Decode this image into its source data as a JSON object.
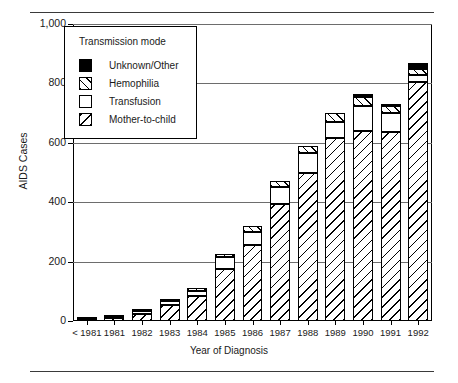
{
  "figure": {
    "y_axis_title": "AIDS Cases",
    "x_axis_title": "Year of Diagnosis"
  },
  "legend": {
    "title": "Transmission mode",
    "items": [
      {
        "label": "Unknown/Other",
        "pattern": "solid-black",
        "color": "#000000"
      },
      {
        "label": "Hemophilia",
        "pattern": "diagonal-up",
        "color": "#000000"
      },
      {
        "label": "Transfusion",
        "pattern": "empty-white",
        "color": "#ffffff"
      },
      {
        "label": "Mother-to-child",
        "pattern": "diagonal-down",
        "color": "#000000"
      }
    ]
  },
  "y_axis": {
    "ticks": [
      "0",
      "200",
      "400",
      "600",
      "800",
      "1,000"
    ],
    "min": 0,
    "max": 1000
  },
  "chart_data": {
    "type": "bar",
    "subtype": "stacked-vertical",
    "title": "",
    "xlabel": "Year of Diagnosis",
    "ylabel": "AIDS Cases",
    "ylim": [
      0,
      1000
    ],
    "yticks": [
      0,
      200,
      400,
      600,
      800,
      1000
    ],
    "ytick_labels": [
      "0",
      "200",
      "400",
      "600",
      "800",
      "1,000"
    ],
    "grid": "horizontal",
    "legend_position": "inside-upper-left",
    "categories": [
      "< 1981",
      "1981",
      "1982",
      "1983",
      "1984",
      "1985",
      "1986",
      "1987",
      "1988",
      "1989",
      "1990",
      "1991",
      "1992"
    ],
    "series": [
      {
        "name": "Mother-to-child",
        "values": [
          5,
          10,
          25,
          55,
          85,
          175,
          255,
          395,
          500,
          615,
          640,
          635,
          805
        ]
      },
      {
        "name": "Transfusion",
        "values": [
          3,
          5,
          8,
          12,
          15,
          40,
          45,
          55,
          65,
          55,
          85,
          65,
          25
        ]
      },
      {
        "name": "Hemophilia",
        "values": [
          2,
          3,
          5,
          8,
          10,
          10,
          20,
          20,
          25,
          30,
          30,
          25,
          20
        ]
      },
      {
        "name": "Unknown/Other",
        "values": [
          0,
          0,
          0,
          0,
          0,
          0,
          0,
          0,
          0,
          0,
          10,
          5,
          20
        ]
      }
    ],
    "totals": [
      10,
      18,
      38,
      75,
      110,
      225,
      320,
      470,
      590,
      700,
      765,
      730,
      870
    ],
    "stack_order_bottom_to_top": [
      "Mother-to-child",
      "Transfusion",
      "Hemophilia",
      "Unknown/Other"
    ]
  }
}
